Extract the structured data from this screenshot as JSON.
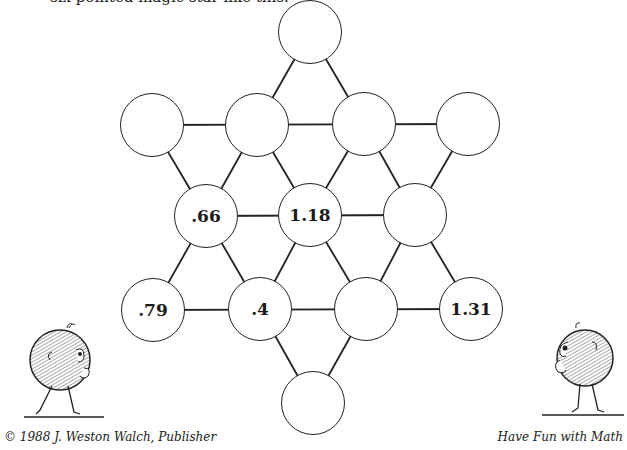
{
  "intro_text": "six-pointed magic star like this.",
  "nodes": [
    {
      "id": "top",
      "value": ""
    },
    {
      "id": "r2c1",
      "value": ""
    },
    {
      "id": "r2c2",
      "value": ""
    },
    {
      "id": "r2c3",
      "value": ""
    },
    {
      "id": "r2c4",
      "value": ""
    },
    {
      "id": "r3c1",
      "value": ".66"
    },
    {
      "id": "r3c2",
      "value": "1.18"
    },
    {
      "id": "r3c3",
      "value": ""
    },
    {
      "id": "r4c1",
      "value": ".79"
    },
    {
      "id": "r4c2",
      "value": ".4"
    },
    {
      "id": "r4c3",
      "value": ""
    },
    {
      "id": "r4c4",
      "value": "1.31"
    },
    {
      "id": "bottom",
      "value": ""
    }
  ],
  "footer": {
    "copyright": "© 1988 J. Weston Walch, Publisher",
    "series": "Have Fun with Math"
  }
}
